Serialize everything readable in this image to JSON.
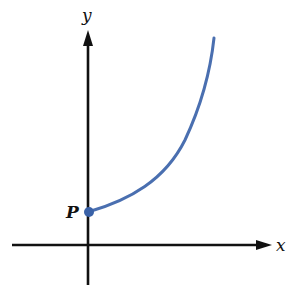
{
  "diagram": {
    "axes": {
      "x_label": "x",
      "y_label": "y"
    },
    "point": {
      "label": "P",
      "position": "on y-axis above origin"
    },
    "curve": {
      "description": "increasing, concave-up curve starting at P",
      "color": "#4a6fb0"
    },
    "colors": {
      "axis": "#111111",
      "curve": "#4a6fb0",
      "point": "#3a62a8"
    }
  }
}
